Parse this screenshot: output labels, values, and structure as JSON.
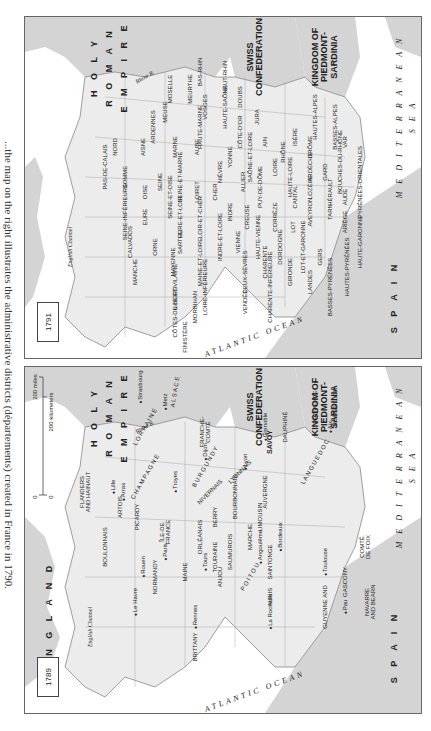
{
  "caption": "...the map on the right illustrates the administrative districts (départements) created in France in 1790.",
  "colors": {
    "foreign_land": "#d4d4d4",
    "france": "#ececec",
    "water": "#ffffff",
    "border": "#666666",
    "text": "#222222"
  },
  "maps": [
    {
      "year": "1791",
      "title": "Départements",
      "countries": [
        "HOLY ROMAN EMPIRE",
        "SWISS CONFEDERATION",
        "KINGDOM OF PIEDMONT-SARDINIA",
        "SPAIN",
        "ENGLAND"
      ],
      "water": [
        "ATLANTIC OCEAN",
        "MEDITERRANEAN SEA",
        "English Channel"
      ],
      "rivers": [
        "Rhine R.",
        "Seine R.",
        "Loire R.",
        "Garonne R.",
        "Rhône R."
      ],
      "labels": {
        "holy": "H O L Y",
        "roman": "R O M A N",
        "empire": "E M P I R E",
        "swiss": "SWISS\nCONFEDERATION",
        "piedmont": "KINGDOM OF\nPIEDMONT-\nSARDINIA",
        "spain": "S P A I N",
        "mediterranean": "M E D I T E R R A N E A N",
        "sea": "S E A",
        "atlantic": "ATLANTIC OCEAN",
        "channel": "English Channel",
        "rhine": "Rhine R.",
        "seine": "Seine R.",
        "loire": "Loire R.",
        "garonne": "Garonne R.",
        "rhone": "Rhône R."
      },
      "departements": [
        "NORD",
        "PAS-DE-CALAIS",
        "SOMME",
        "AISNE",
        "ARDENNES",
        "MEUSE",
        "MOSELLE",
        "MEURTHE",
        "BAS-RHIN",
        "HAUT-RHIN",
        "VOSGES",
        "HAUTE-MARNE",
        "HAUTE-SAÔNE",
        "DOUBS",
        "JURA",
        "CÔTE-D'OR",
        "MARNE",
        "AUBE",
        "YONNE",
        "SEINE-ET-MARNE",
        "SEINE",
        "OISE",
        "SEINE-ET-OISE",
        "SEINE-INFÉRIEURE",
        "EURE",
        "CALVADOS",
        "MANCHE",
        "ORNE",
        "EURE-ET-LOIR",
        "LOIRET",
        "LOIR-ET-CHER",
        "SARTHE",
        "MAYENNE",
        "ILLE-ET-VILAINE",
        "CÔTES-DU-NORD",
        "FINISTÈRE",
        "MORBIHAN",
        "LOIRE-INFÉRIEURE",
        "MAINE-ET-LOIRE",
        "INDRE-ET-LOIRE",
        "INDRE",
        "CHER",
        "NIÈVRE",
        "SAÔNE-ET-LOIRE",
        "AIN",
        "ALLIER",
        "PUY-DE-DÔME",
        "LOIRE",
        "RHÔNE",
        "ISÈRE",
        "HAUTES-ALPES",
        "BASSES-ALPES",
        "VAR",
        "BOUCHES-DU-RHÔNE",
        "DRÔME",
        "ARDÈCHE",
        "HAUTE-LOIRE",
        "CANTAL",
        "LOZÈRE",
        "GARD",
        "HÉRAULT",
        "AVEYRON",
        "TARN",
        "AUDE",
        "PYRÉNÉES-ORIENTALES",
        "ARIÈGE",
        "HAUTE-GARONNE",
        "HAUTES-PYRÉNÉES",
        "BASSES-PYRÉNÉES",
        "LANDES",
        "GERS",
        "LOT-ET-GARONNE",
        "LOT",
        "CORRÈZE",
        "DORDOGNE",
        "GIRONDE",
        "CHARENTE",
        "CHARENTE-INFÉRIEURE",
        "HAUTE-VIENNE",
        "CREUSE",
        "VIENNE",
        "DEUX-SÈVRES",
        "VENDÉE"
      ]
    },
    {
      "year": "1789",
      "title": "Provinces",
      "scale": {
        "miles": "200 miles",
        "km": "200 kilometers",
        "zero": "0"
      },
      "labels": {
        "england": "E N G L A N D",
        "holy": "H O L Y",
        "roman": "R O M A N",
        "empire": "E M P I R E",
        "swiss": "SWISS\nCONFEDERATION",
        "piedmont": "KINGDOM OF\nPIEDMONT-\nSARDINIA",
        "spain": "S P A I N",
        "mediterranean": "M E D I T E R R A N E A N",
        "sea": "S E A",
        "atlantic": "ATLANTIC OCEAN",
        "channel": "English Channel",
        "rhine": "Rhine R.",
        "seine": "Seine R.",
        "loire": "Loire R.",
        "garonne": "Garonne R.",
        "rhone": "Rhône R."
      },
      "provinces": [
        "FLANDERS AND HAINAUT",
        "ARTOIS",
        "BOULONNAIS",
        "PICARDY",
        "ÎLE-DE-FRANCE",
        "NORMANDY",
        "CHAMPAGNE",
        "LORRAINE",
        "ALSACE",
        "FRANCHE-COMTÉ",
        "BURGUNDY",
        "ORLÉANAIS",
        "MAINE",
        "BRITTANY",
        "ANJOU",
        "TOURAINE",
        "SAUMUROIS",
        "BERRY",
        "NIVERNAIS",
        "BOURBONNAIS",
        "LYONNAIS",
        "SAVOY",
        "DAUPHINÉ",
        "PROVENCE",
        "POITOU",
        "AUNIS",
        "SAINTONGE",
        "MARCHE",
        "LIMOUSIN",
        "AUVERGNE",
        "LANGUEDOC",
        "ROUSSILLON",
        "GUYENNE AND GASCONY",
        "NAVARRE AND BEARN",
        "COMTÉ DE FOIX"
      ],
      "cities": [
        "Lille",
        "Arras",
        "Rouen",
        "Paris",
        "Le Havre",
        "Rennes",
        "Tours",
        "La Rochelle",
        "Angoulême",
        "Bordeaux",
        "Pau",
        "Toulouse",
        "Metz",
        "Strasbourg",
        "Troyes",
        "Dijon",
        "Lyon",
        "Grenoble",
        "Aix"
      ],
      "provinces_pos": {
        "flanders": "FLANDERS\nAND HAINAUT",
        "artois": "ARTOIS",
        "boulonnais": "BOULONNAIS",
        "picardy": "PICARDY",
        "ile": "ÎLE-DE\nFRANCE",
        "normandy": "NORMANDY",
        "champagne": "C H A M P A G N E",
        "lorraine": "L O R R A I N E",
        "alsace": "A L S A C E",
        "franche": "FRANCHE-\nCOMTÉ",
        "burgundy": "B U R G U N D Y",
        "orleanais": "ORLÉANAIS",
        "maine": "MAINE",
        "brittany": "BRITTANY",
        "anjou": "ANJOU",
        "touraine": "TOURAINE",
        "saumurois": "SAUMUROIS",
        "berry": "BERRY",
        "nivernais": "NIVERNAIS",
        "bourbonnais": "BOURBONNAIS",
        "lyonnais": "LYONNAIS",
        "savoy": "SAVOY",
        "dauphine": "DAUPHINÉ",
        "provence": "PROVENCE",
        "poitou": "P O I T O U",
        "aunis": "AUNIS",
        "saintonge": "SAINTONGE",
        "marche": "MARCHE",
        "limousin": "LIMOUSIN",
        "auvergne": "AUVERGNE",
        "languedoc": "L A N G U E D O C",
        "roussillon": "ROUSSILLON",
        "guyenne": "GUYENNE  AND",
        "gascony": "GASCONY",
        "navarre": "NAVARRE\nAND BEARN",
        "foix": "COMTÉ\nDE FOIX"
      },
      "city_pos": {
        "lille": "Lille",
        "arras": "Arras",
        "rouen": "Rouen",
        "paris": "Paris",
        "lehavre": "Le Havre",
        "rennes": "Rennes",
        "tours": "Tours",
        "larochelle": "La Rochelle",
        "angouleme": "Angoulême",
        "bordeaux": "Bordeaux",
        "pau": "Pau",
        "toulouse": "Toulouse",
        "metz": "Metz",
        "strasbourg": "Strasbourg",
        "troyes": "Troyes",
        "dijon": "Dijon",
        "lyon": "Lyon",
        "grenoble": "Grenoble",
        "aix": "Aix"
      }
    }
  ]
}
